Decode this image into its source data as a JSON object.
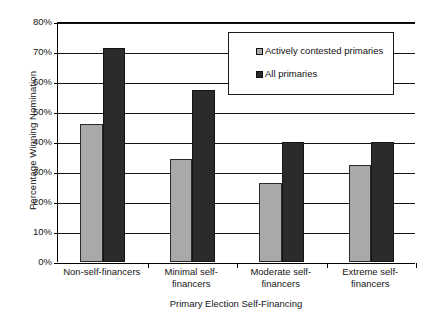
{
  "chart_data": {
    "type": "bar",
    "title": "",
    "xlabel": "Primary Election Self-Financing",
    "ylabel": "Percentage Winning Nomination",
    "categories": [
      "Non-self-financers",
      "Minimal self-financers",
      "Moderate self-financers",
      "Extreme self-financers"
    ],
    "series": [
      {
        "name": "Actively contested primaries",
        "color": "#a9a9a9",
        "values": [
          46,
          34.5,
          26.5,
          32.5
        ]
      },
      {
        "name": "All primaries",
        "color": "#2b2b2b",
        "values": [
          71.5,
          57.5,
          40,
          40
        ]
      }
    ],
    "ylim": [
      0,
      80
    ],
    "ytick_values": [
      0,
      10,
      20,
      30,
      40,
      50,
      60,
      70,
      80
    ],
    "ytick_labels": [
      "0%",
      "10%",
      "20%",
      "30%",
      "40%",
      "50%",
      "60%",
      "70%",
      "80%"
    ],
    "grid": true,
    "legend_position": "upper-right-inside"
  },
  "axes": {
    "y_title": "Percentage Winning Nomination",
    "x_title": "Primary Election Self-Financing",
    "y_ticks": [
      "80%",
      "70%",
      "60%",
      "50%",
      "40%",
      "30%",
      "20%",
      "10%",
      "0%"
    ]
  },
  "x_categories": [
    {
      "line1": "Non-self-financers",
      "line2": ""
    },
    {
      "line1": "Minimal self-financers",
      "line2": ""
    },
    {
      "line1": "Moderate self-",
      "line2": "financers"
    },
    {
      "line1": "Extreme self-",
      "line2": "financers"
    }
  ],
  "legend": {
    "entries": [
      {
        "label": "Actively contested primaries",
        "color": "#a9a9a9"
      },
      {
        "label": "All primaries",
        "color": "#2b2b2b"
      }
    ]
  }
}
